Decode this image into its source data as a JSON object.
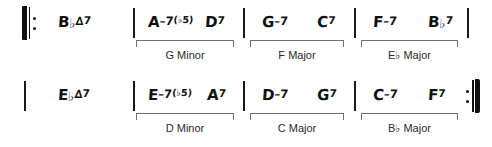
{
  "document": {
    "type": "jazz-chord-chart",
    "title": "",
    "systems": [
      {
        "id": "system-1",
        "repeat_start": true,
        "repeat_end": false,
        "measures": [
          {
            "id": "m1",
            "chords": [
              {
                "root": "B",
                "accidental": "♭",
                "quality": "∆",
                "extension": "7",
                "alteration": "",
                "full": "B♭∆7"
              }
            ],
            "analysis": null
          },
          {
            "id": "m2",
            "chords": [
              {
                "root": "A",
                "accidental": "",
                "quality": "–7",
                "extension": "",
                "alteration": "(♭5)",
                "full": "A–7(♭5)"
              },
              {
                "root": "D",
                "accidental": "",
                "quality": "",
                "extension": "7",
                "alteration": "",
                "full": "D7"
              }
            ],
            "analysis": {
              "key": "G Minor",
              "key_root": "G",
              "key_accidental": "",
              "key_mode": "Minor"
            }
          },
          {
            "id": "m3",
            "chords": [
              {
                "root": "G",
                "accidental": "",
                "quality": "–7",
                "extension": "",
                "alteration": "",
                "full": "G–7"
              },
              {
                "root": "C",
                "accidental": "",
                "quality": "",
                "extension": "7",
                "alteration": "",
                "full": "C7"
              }
            ],
            "analysis": {
              "key": "F Major",
              "key_root": "F",
              "key_accidental": "",
              "key_mode": "Major"
            }
          },
          {
            "id": "m4",
            "chords": [
              {
                "root": "F",
                "accidental": "",
                "quality": "–7",
                "extension": "",
                "alteration": "",
                "full": "F–7"
              },
              {
                "root": "B",
                "accidental": "♭",
                "quality": "",
                "extension": "7",
                "alteration": "",
                "full": "B♭7"
              }
            ],
            "analysis": {
              "key": "E♭ Major",
              "key_root": "E",
              "key_accidental": "♭",
              "key_mode": "Major"
            }
          }
        ]
      },
      {
        "id": "system-2",
        "repeat_start": false,
        "repeat_end": true,
        "measures": [
          {
            "id": "m5",
            "chords": [
              {
                "root": "E",
                "accidental": "♭",
                "quality": "∆",
                "extension": "7",
                "alteration": "",
                "full": "E♭∆7"
              }
            ],
            "analysis": null
          },
          {
            "id": "m6",
            "chords": [
              {
                "root": "E",
                "accidental": "",
                "quality": "–7",
                "extension": "",
                "alteration": "(♭5)",
                "full": "E–7(♭5)"
              },
              {
                "root": "A",
                "accidental": "",
                "quality": "",
                "extension": "7",
                "alteration": "",
                "full": "A7"
              }
            ],
            "analysis": {
              "key": "D Minor",
              "key_root": "D",
              "key_accidental": "",
              "key_mode": "Minor"
            }
          },
          {
            "id": "m7",
            "chords": [
              {
                "root": "D",
                "accidental": "",
                "quality": "–7",
                "extension": "",
                "alteration": "",
                "full": "D–7"
              },
              {
                "root": "G",
                "accidental": "",
                "quality": "",
                "extension": "7",
                "alteration": "",
                "full": "G7"
              }
            ],
            "analysis": {
              "key": "C Major",
              "key_root": "C",
              "key_accidental": "",
              "key_mode": "Major"
            }
          },
          {
            "id": "m8",
            "chords": [
              {
                "root": "C",
                "accidental": "",
                "quality": "–7",
                "extension": "",
                "alteration": "",
                "full": "C–7"
              },
              {
                "root": "F",
                "accidental": "",
                "quality": "",
                "extension": "7",
                "alteration": "",
                "full": "F7"
              }
            ],
            "analysis": {
              "key": "B♭ Major",
              "key_root": "B",
              "key_accidental": "♭",
              "key_mode": "Major"
            }
          }
        ]
      }
    ],
    "colors": {
      "ink": "#111111",
      "bracket": "#6f6f6f",
      "label": "#2b2b2b",
      "paper": "#ffffff"
    }
  }
}
